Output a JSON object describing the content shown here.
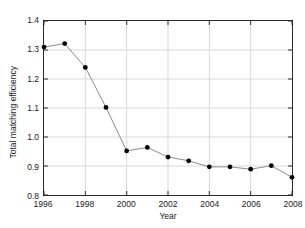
{
  "chart_data": {
    "type": "line",
    "title": "",
    "xlabel": "Year",
    "ylabel": "Total matching efficiency",
    "x": [
      1996,
      1997,
      1998,
      1999,
      2000,
      2001,
      2002,
      2003,
      2004,
      2005,
      2006,
      2007,
      2008
    ],
    "values": [
      1.31,
      1.322,
      1.24,
      1.102,
      0.952,
      0.964,
      0.931,
      0.918,
      0.897,
      0.897,
      0.889,
      0.901,
      0.861
    ],
    "series": [
      {
        "name": "Total matching efficiency",
        "values": [
          1.31,
          1.322,
          1.24,
          1.102,
          0.952,
          0.964,
          0.931,
          0.918,
          0.897,
          0.897,
          0.889,
          0.901,
          0.861
        ]
      }
    ],
    "xlim": [
      1996,
      2008
    ],
    "ylim": [
      0.8,
      1.4
    ],
    "xticks": [
      1996,
      1998,
      2000,
      2002,
      2004,
      2006,
      2008
    ],
    "xtick_labels": [
      "1996",
      "1998",
      "2000",
      "2002",
      "2004",
      "2006",
      "2008"
    ],
    "yticks": [
      0.8,
      0.9,
      1.0,
      1.1,
      1.2,
      1.3,
      1.4
    ],
    "ytick_labels": [
      "0.8",
      "0.9",
      "1.0",
      "1.1",
      "1.2",
      "1.3",
      "1.4"
    ],
    "grid": true,
    "grid_color": "#d9d9d9",
    "legend": null,
    "legend_position": "none",
    "marker": "filled-circle",
    "marker_color": "#000000",
    "line_color": "#8c8c8c",
    "axis_color": "#2b2b2b",
    "background_color": "#ffffff"
  }
}
